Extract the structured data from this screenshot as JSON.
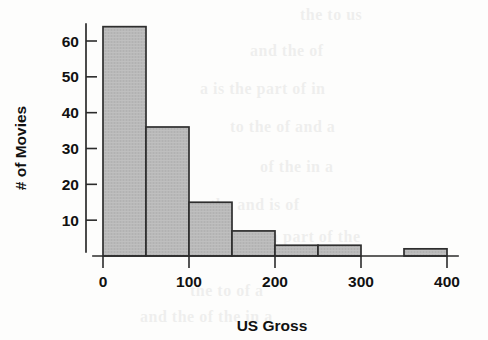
{
  "figure": {
    "name": "us-gross-histogram",
    "background_color": "#fdfdfc",
    "ink_color": "#2b2b2b",
    "bar_fill_color": "#b9b9b9",
    "bar_edge_color": "#2e2e2e"
  },
  "chart_data": {
    "type": "bar",
    "title": "",
    "xlabel": "US Gross",
    "ylabel": "# of Movies",
    "categories": [
      "0-50",
      "50-100",
      "100-150",
      "150-200",
      "200-250",
      "250-300",
      "300-350",
      "350-400"
    ],
    "bin_edges": [
      0,
      50,
      100,
      150,
      200,
      250,
      300,
      350,
      400
    ],
    "bin_width": 50,
    "values": [
      64,
      36,
      15,
      7,
      3,
      3,
      0,
      2
    ],
    "bars": [
      {
        "label": "0-50",
        "x0": 0,
        "x1": 50,
        "value": 64
      },
      {
        "label": "50-100",
        "x0": 50,
        "x1": 100,
        "value": 36
      },
      {
        "label": "100-150",
        "x0": 100,
        "x1": 150,
        "value": 15
      },
      {
        "label": "150-200",
        "x0": 150,
        "x1": 200,
        "value": 7
      },
      {
        "label": "200-250",
        "x0": 200,
        "x1": 250,
        "value": 3
      },
      {
        "label": "250-300",
        "x0": 250,
        "x1": 300,
        "value": 3
      },
      {
        "label": "300-350",
        "x0": 300,
        "x1": 350,
        "value": 0
      },
      {
        "label": "350-400",
        "x0": 350,
        "x1": 400,
        "value": 2
      }
    ],
    "xlim": [
      0,
      400
    ],
    "ylim": [
      0,
      68
    ],
    "xticks": [
      0,
      100,
      200,
      300,
      400
    ],
    "xtick_labels": [
      "0",
      "100",
      "200",
      "300",
      "400"
    ],
    "yticks": [
      10,
      20,
      30,
      40,
      50,
      60
    ],
    "ytick_labels": [
      "10",
      "20",
      "30",
      "40",
      "50",
      "60"
    ],
    "grid": false,
    "legend": null
  },
  "axes": {
    "y_label_text": "# of Movies",
    "x_label_text": "US Gross",
    "ytick_labels": [
      "60",
      "50",
      "40",
      "30",
      "20",
      "10"
    ],
    "xtick_labels": [
      "0",
      "100",
      "200",
      "300",
      "400"
    ]
  },
  "ghost_text": [
    {
      "text": "the to us",
      "x": 300,
      "y": 16,
      "size": 15
    },
    {
      "text": "and the of",
      "x": 250,
      "y": 52,
      "size": 15
    },
    {
      "text": "a is the part of in",
      "x": 200,
      "y": 90,
      "size": 15
    },
    {
      "text": "to the of and a",
      "x": 230,
      "y": 128,
      "size": 15
    },
    {
      "text": "of the in a",
      "x": 260,
      "y": 168,
      "size": 15
    },
    {
      "text": "the and is of",
      "x": 210,
      "y": 206,
      "size": 15
    },
    {
      "text": "a part of the",
      "x": 270,
      "y": 238,
      "size": 15
    },
    {
      "text": "the to of a",
      "x": 190,
      "y": 292,
      "size": 15
    },
    {
      "text": "and the of the in a",
      "x": 140,
      "y": 318,
      "size": 15
    }
  ]
}
